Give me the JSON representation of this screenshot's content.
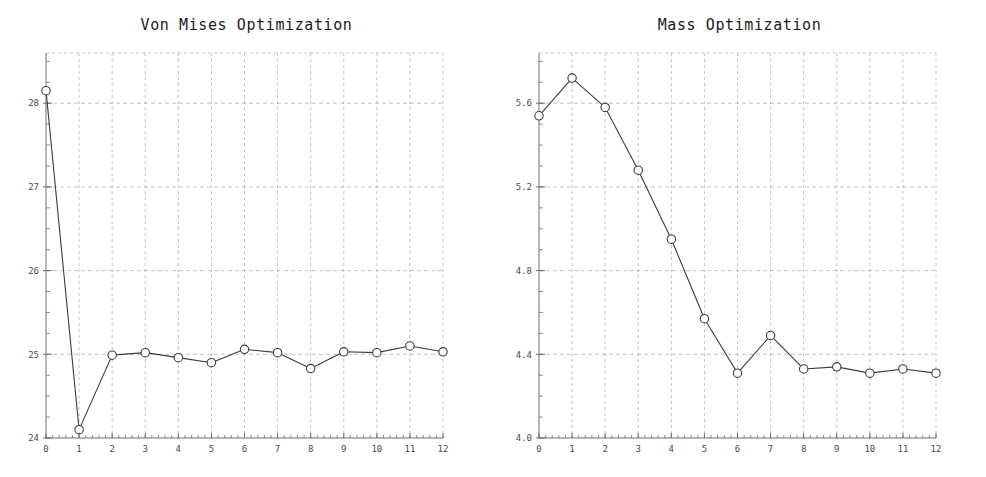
{
  "page": {
    "width": 986,
    "height": 477,
    "background": "#ffffff"
  },
  "panels": [
    {
      "id": "von-mises",
      "title": "Von Mises Optimization"
    },
    {
      "id": "mass",
      "title": "Mass Optimization"
    }
  ],
  "style": {
    "line_color": "#3c3c3c",
    "marker_edge_color": "#3c3c3c",
    "marker_face_color": "#ffffff",
    "grid_color": "#9a9ab0",
    "axis_color": "#6e6e80",
    "tick_label_color": "#4a4a4a",
    "title_color": "#1c1c1c"
  },
  "chart_data": [
    {
      "type": "line",
      "title": "Von Mises Optimization",
      "xlabel": "",
      "ylabel": "",
      "x": [
        0,
        1,
        2,
        3,
        4,
        5,
        6,
        7,
        8,
        9,
        10,
        11,
        12
      ],
      "values": [
        28.15,
        24.1,
        24.99,
        25.02,
        24.96,
        24.9,
        25.06,
        25.02,
        24.83,
        25.03,
        25.02,
        25.1,
        25.03
      ],
      "xlim": [
        0,
        12
      ],
      "ylim": [
        24,
        28.6
      ],
      "xticks": [
        0,
        1,
        2,
        3,
        4,
        5,
        6,
        7,
        8,
        9,
        10,
        11,
        12
      ],
      "xtick_labels": [
        "0",
        "1",
        "2",
        "3",
        "4",
        "5",
        "6",
        "7",
        "8",
        "9",
        "10",
        "11",
        "12"
      ],
      "yticks": [
        24,
        25,
        26,
        27,
        28
      ],
      "ytick_labels": [
        "24",
        "25",
        "26",
        "27",
        "28"
      ],
      "grid": true,
      "legend": "none",
      "marker": "circle"
    },
    {
      "type": "line",
      "title": "Mass Optimization",
      "xlabel": "",
      "ylabel": "",
      "x": [
        0,
        1,
        2,
        3,
        4,
        5,
        6,
        7,
        8,
        9,
        10,
        11,
        12
      ],
      "values": [
        5.54,
        5.72,
        5.58,
        5.28,
        4.95,
        4.57,
        4.31,
        4.49,
        4.33,
        4.34,
        4.31,
        4.33,
        4.31
      ],
      "xlim": [
        0,
        12
      ],
      "ylim": [
        4.0,
        5.84
      ],
      "xticks": [
        0,
        1,
        2,
        3,
        4,
        5,
        6,
        7,
        8,
        9,
        10,
        11,
        12
      ],
      "xtick_labels": [
        "0",
        "1",
        "2",
        "3",
        "4",
        "5",
        "6",
        "7",
        "8",
        "9",
        "10",
        "11",
        "12"
      ],
      "yticks": [
        4.0,
        4.4,
        4.8,
        5.2,
        5.6
      ],
      "ytick_labels": [
        "4.0",
        "4.4",
        "4.8",
        "5.2",
        "5.6"
      ],
      "grid": true,
      "legend": "none",
      "marker": "circle"
    }
  ]
}
